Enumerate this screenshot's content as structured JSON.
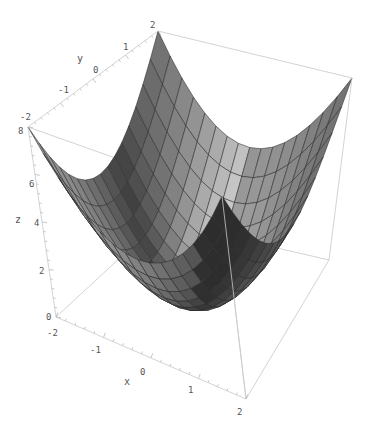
{
  "chart_data": {
    "type": "surface3d",
    "function": "z = x^2 + y^2",
    "title": "",
    "x": {
      "label": "x",
      "range": [
        -2,
        2
      ],
      "ticks": [
        -2,
        -1,
        0,
        1,
        2
      ]
    },
    "y": {
      "label": "y",
      "range": [
        -2,
        2
      ],
      "ticks": [
        -2,
        -1,
        0,
        1,
        2
      ]
    },
    "z": {
      "label": "z",
      "range": [
        0,
        8
      ],
      "ticks": [
        0,
        2,
        4,
        6,
        8
      ]
    },
    "mesh": {
      "x_lines": 16,
      "y_lines": 16
    },
    "box": true,
    "grid": false,
    "legend": null,
    "sample_values": [
      {
        "x": -2,
        "y": -2,
        "z": 8
      },
      {
        "x": -2,
        "y": 2,
        "z": 8
      },
      {
        "x": 2,
        "y": -2,
        "z": 8
      },
      {
        "x": 2,
        "y": 2,
        "z": 8
      },
      {
        "x": 0,
        "y": 0,
        "z": 0
      },
      {
        "x": 2,
        "y": 0,
        "z": 4
      },
      {
        "x": 0,
        "y": 2,
        "z": 4
      },
      {
        "x": -2,
        "y": 0,
        "z": 4
      },
      {
        "x": 0,
        "y": -2,
        "z": 4
      },
      {
        "x": 1,
        "y": 1,
        "z": 2
      }
    ],
    "colors": {
      "surface_light": "#f2f2f2",
      "surface_dark": "#3c3c3c",
      "mesh": "#2a2a2a",
      "box": "#c8c8c8",
      "text": "#555555"
    }
  },
  "labels": {
    "x_axis": "x",
    "y_axis": "y",
    "z_axis": "z",
    "x_ticks": [
      "-2",
      "-1",
      "0",
      "1",
      "2"
    ],
    "y_ticks": [
      "-2",
      "-1",
      "0",
      "1",
      "2"
    ],
    "z_ticks": [
      "0",
      "2",
      "4",
      "6",
      "8"
    ]
  }
}
